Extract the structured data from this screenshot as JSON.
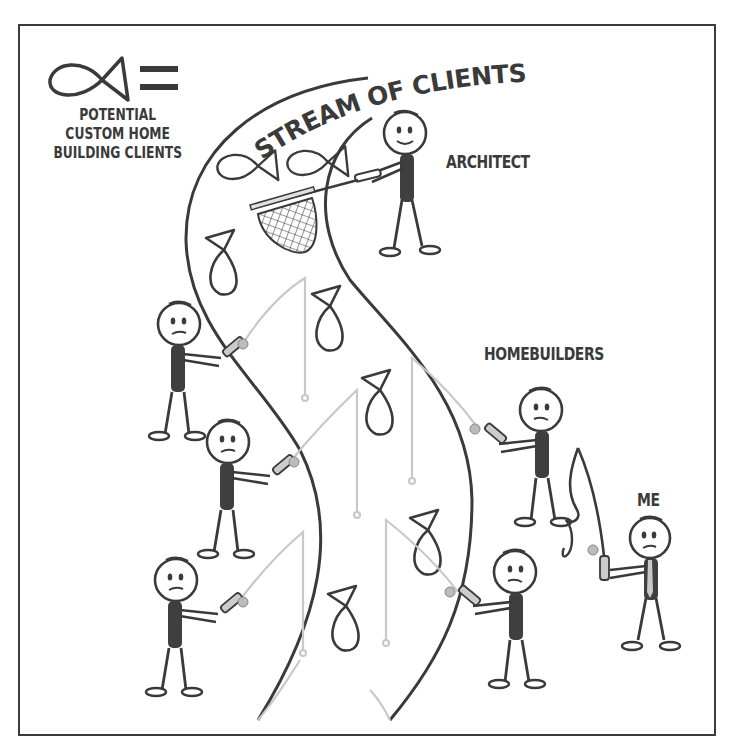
{
  "legend": {
    "symbol": "fish-icon",
    "equals": "=",
    "lines": [
      "POTENTIAL",
      "CUSTOM HOME",
      "BUILDING CLIENTS"
    ]
  },
  "title": "STREAM OF CLIENTS",
  "labels": {
    "architect": "ARCHITECT",
    "homebuilders": "HOMEBUILDERS",
    "me": "ME"
  },
  "characters": [
    {
      "role": "architect",
      "tool": "net",
      "expression": "smile"
    },
    {
      "role": "homebuilder",
      "tool": "fishing-rod",
      "expression": "frown",
      "position": "left-top"
    },
    {
      "role": "homebuilder",
      "tool": "fishing-rod",
      "expression": "frown",
      "position": "left-middle"
    },
    {
      "role": "homebuilder",
      "tool": "fishing-rod",
      "expression": "frown",
      "position": "left-bottom"
    },
    {
      "role": "homebuilder",
      "tool": "fishing-rod",
      "expression": "frown",
      "position": "right-top"
    },
    {
      "role": "homebuilder",
      "tool": "fishing-rod",
      "expression": "frown",
      "position": "right-bottom"
    },
    {
      "role": "me",
      "tool": "fishing-rod-tangled",
      "expression": "frown"
    }
  ],
  "colors": {
    "ink": "#3a3a3a",
    "line_light": "#c8c8c8",
    "body_fill": "#3f3f3f",
    "background": "#ffffff"
  }
}
